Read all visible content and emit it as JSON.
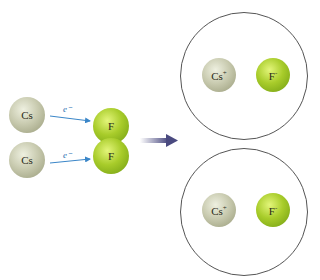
{
  "diagram": {
    "before": {
      "donors": [
        {
          "symbol": "Cs"
        },
        {
          "symbol": "Cs"
        }
      ],
      "acceptors": [
        {
          "symbol": "F"
        },
        {
          "symbol": "F"
        }
      ],
      "electron_labels": [
        "e⁻",
        "e⁻"
      ]
    },
    "after": {
      "pairs": [
        {
          "cation": "Cs",
          "cation_charge": "+",
          "anion": "F",
          "anion_charge": "-"
        },
        {
          "cation": "Cs",
          "cation_charge": "+",
          "anion": "F",
          "anion_charge": "-"
        }
      ]
    },
    "colors": {
      "cesium": "#c9cbb0",
      "fluorine": "#a8cc2a",
      "electron_arrow": "#3a86c8",
      "reaction_arrow": "#4a4a80",
      "ring": "#555555"
    }
  }
}
